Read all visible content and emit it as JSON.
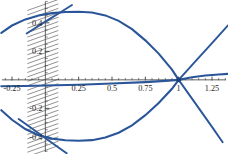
{
  "chart_data": {
    "type": "line",
    "title": "",
    "xlabel": "",
    "ylabel": "",
    "xlim": [
      -0.34,
      1.37
    ],
    "ylim": [
      -0.52,
      0.56
    ],
    "grid": false,
    "legend": "none",
    "accent_color": "#2a5699",
    "axis_color": "#3a3a3a",
    "convergence_point": {
      "x": 1,
      "y": 0
    },
    "x_ticks": [
      {
        "value": -0.25,
        "label": "-0.25"
      },
      {
        "value": 0.25,
        "label": "0.25"
      },
      {
        "value": 0.5,
        "label": "0.5"
      },
      {
        "value": 0.75,
        "label": "0.75"
      },
      {
        "value": 1,
        "label": "1"
      },
      {
        "value": 1.25,
        "label": "1.25"
      }
    ],
    "x_minor_ticks": [
      -0.3,
      -0.2,
      -0.15,
      -0.1,
      -0.05,
      0.05,
      0.1,
      0.15,
      0.2,
      0.3,
      0.35,
      0.4,
      0.45,
      0.55,
      0.6,
      0.65,
      0.7,
      0.8,
      0.85,
      0.9,
      0.95,
      1.05,
      1.1,
      1.15,
      1.2,
      1.3,
      1.35
    ],
    "y_ticks": [
      {
        "value": 0.4,
        "label": "0.4"
      },
      {
        "value": 0.2,
        "label": "0.2"
      },
      {
        "value": -0.2,
        "label": "-0.2"
      },
      {
        "value": -0.4,
        "label": "-0.4"
      }
    ],
    "y_minor_ticks": [
      -0.5,
      -0.45,
      -0.35,
      -0.3,
      -0.25,
      -0.15,
      -0.1,
      -0.05,
      0.05,
      0.1,
      0.15,
      0.25,
      0.3,
      0.35,
      0.45,
      0.5,
      0.55
    ],
    "series": [
      {
        "name": "upper-curve",
        "points": [
          [
            -0.33,
            0.33
          ],
          [
            -0.25,
            0.381
          ],
          [
            -0.15,
            0.424
          ],
          [
            -0.05,
            0.452
          ],
          [
            0.05,
            0.468
          ],
          [
            0.15,
            0.476
          ],
          [
            0.25,
            0.478
          ],
          [
            0.35,
            0.472
          ],
          [
            0.45,
            0.452
          ],
          [
            0.55,
            0.414
          ],
          [
            0.65,
            0.356
          ],
          [
            0.75,
            0.277
          ],
          [
            0.85,
            0.184
          ],
          [
            0.95,
            0.072
          ],
          [
            1.0,
            0.0
          ]
        ]
      },
      {
        "name": "lower-curve",
        "points": [
          [
            -0.33,
            -0.213
          ],
          [
            -0.25,
            -0.28
          ],
          [
            -0.15,
            -0.345
          ],
          [
            -0.05,
            -0.388
          ],
          [
            0.05,
            -0.412
          ],
          [
            0.15,
            -0.424
          ],
          [
            0.25,
            -0.427
          ],
          [
            0.35,
            -0.423
          ],
          [
            0.45,
            -0.405
          ],
          [
            0.55,
            -0.371
          ],
          [
            0.65,
            -0.319
          ],
          [
            0.75,
            -0.248
          ],
          [
            0.85,
            -0.163
          ],
          [
            0.95,
            -0.063
          ],
          [
            1.0,
            0.0
          ]
        ]
      },
      {
        "name": "flat-curve",
        "points": [
          [
            -0.33,
            -0.045
          ],
          [
            -0.15,
            -0.043
          ],
          [
            0.0,
            -0.04
          ],
          [
            0.25,
            -0.034
          ],
          [
            0.5,
            -0.026
          ],
          [
            0.75,
            -0.016
          ],
          [
            0.9,
            -0.007
          ],
          [
            1.0,
            0.0
          ]
        ]
      },
      {
        "name": "near-zero-curve",
        "points": [
          [
            1.0,
            0.0
          ],
          [
            1.1,
            0.018
          ],
          [
            1.2,
            0.03
          ],
          [
            1.3,
            0.038
          ],
          [
            1.37,
            0.042
          ]
        ]
      },
      {
        "name": "rising-line",
        "points": [
          [
            1.0,
            0.0
          ],
          [
            1.12,
            0.125
          ],
          [
            1.25,
            0.258
          ],
          [
            1.37,
            0.382
          ]
        ]
      },
      {
        "name": "falling-line",
        "points": [
          [
            1.0,
            0.0
          ],
          [
            1.12,
            -0.158
          ],
          [
            1.25,
            -0.33
          ],
          [
            1.33,
            -0.438
          ]
        ]
      },
      {
        "name": "upper-tangent-line",
        "points": [
          [
            -0.14,
            0.325
          ],
          [
            0.0,
            0.408
          ],
          [
            0.12,
            0.478
          ],
          [
            0.2,
            0.525
          ]
        ]
      },
      {
        "name": "lower-tangent-line",
        "points": [
          [
            -0.2,
            -0.275
          ],
          [
            -0.05,
            -0.375
          ],
          [
            0.08,
            -0.462
          ],
          [
            0.16,
            -0.515
          ]
        ]
      }
    ]
  }
}
